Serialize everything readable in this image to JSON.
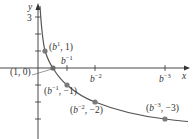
{
  "axes": {
    "x_label": "x",
    "y_label": "y",
    "y_tick_label": "3"
  },
  "x_ticks": [
    {
      "base": "b",
      "exp": "−1",
      "label": "b^-1"
    },
    {
      "base": "b",
      "exp": "−2",
      "label": "b^-2"
    },
    {
      "base": "b",
      "exp": "−3",
      "label": "b^-3"
    }
  ],
  "points": [
    {
      "id": "p1",
      "label": "(b^1, 1)",
      "base": "b",
      "exp": "1",
      "y": "1"
    },
    {
      "id": "p0",
      "label": "(1, 0)"
    },
    {
      "id": "pm1",
      "label": "(b^-1, -1)",
      "base": "b",
      "exp": "−1",
      "y": "−1"
    },
    {
      "id": "pm2",
      "label": "(b^-2, -2)",
      "base": "b",
      "exp": "−2",
      "y": "−2"
    },
    {
      "id": "pm3",
      "label": "(b^-3, -3)",
      "base": "b",
      "exp": "−3",
      "y": "−3"
    }
  ],
  "colors": {
    "axis": "#333333",
    "curve": "#555555",
    "point": "#7a7a7a"
  }
}
